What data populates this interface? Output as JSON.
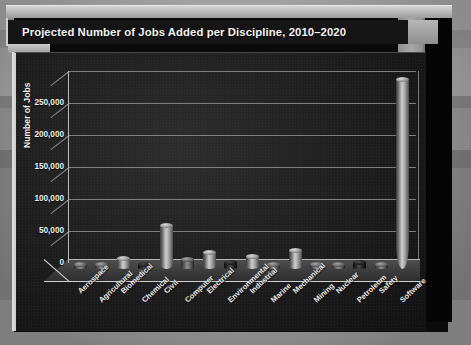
{
  "title": "Projected Number of Jobs Added per Discipline, 2010–2020",
  "chart_data": {
    "type": "bar",
    "title": "Projected Number of Jobs Added per Discipline, 2010–2020",
    "xlabel": "",
    "ylabel": "Number of Jobs",
    "ylim": [
      0,
      300000
    ],
    "ytick_labels": [
      "0",
      "50,000",
      "100,000",
      "150,000",
      "200,000",
      "250,000"
    ],
    "ytick_values": [
      0,
      50000,
      100000,
      150000,
      200000,
      250000
    ],
    "grid": true,
    "legend": "none",
    "style": "3d-cylinder-bars",
    "categories": [
      "Aerospace",
      "Agricultural",
      "Biomedical",
      "Chemical",
      "Civil",
      "Computer",
      "Electrical",
      "Environmental",
      "Industrial",
      "Marine",
      "Mechanical",
      "Mining",
      "Nuclear",
      "Petroleum",
      "Safety",
      "Software"
    ],
    "values": [
      5000,
      4000,
      16000,
      6000,
      67000,
      14000,
      25000,
      10000,
      18000,
      2000,
      28000,
      3000,
      2000,
      9000,
      5000,
      295000
    ],
    "series": [
      {
        "name": "Projected Jobs Added",
        "values": [
          5000,
          4000,
          16000,
          6000,
          67000,
          14000,
          25000,
          10000,
          18000,
          2000,
          28000,
          3000,
          2000,
          9000,
          5000,
          295000
        ]
      }
    ]
  }
}
